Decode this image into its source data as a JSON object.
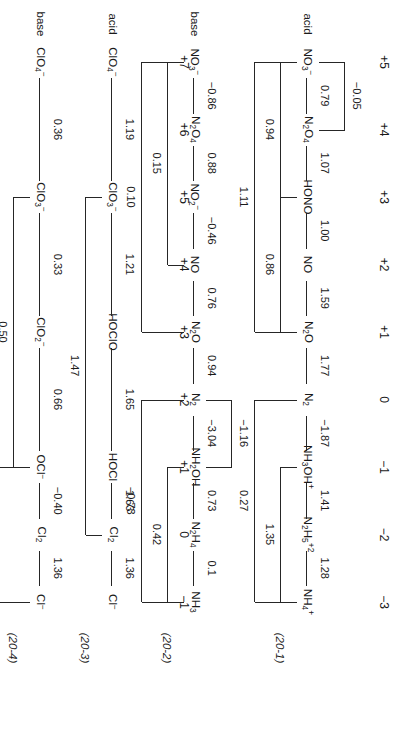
{
  "figure": {
    "kind": "latimer-diagrams",
    "labels": [
      "(20-1)",
      "(20-2)",
      "(20-3)",
      "(20-4)"
    ],
    "row_labels": {
      "acid": "acid",
      "base": "base"
    }
  },
  "chart_data": {
    "type": "diagram",
    "subtype": "latimer",
    "units": "V",
    "panels": [
      {
        "id": "20-1",
        "label": "(20-1)",
        "row_label": "acid",
        "element": "N",
        "oxidation_states": [
          "+5",
          "+4",
          "+3",
          "+2",
          "+1",
          "0",
          "-1",
          "-2",
          "-3"
        ],
        "species": [
          "NO3-",
          "N2O4",
          "HONO",
          "NO",
          "N2O",
          "N2",
          "NH3OH+",
          "N2H5+2",
          "NH4+"
        ],
        "species_display": [
          "NO₃⁻",
          "N₂O₄",
          "HONO",
          "NO",
          "N₂O",
          "N₂",
          "NH₃OH⁺",
          "N₂H₅⁺²",
          "NH₄⁺"
        ],
        "steps": [
          {
            "from": "NO3-",
            "to": "N2O4",
            "E": "0.79"
          },
          {
            "from": "N2O4",
            "to": "HONO",
            "E": "1.07"
          },
          {
            "from": "HONO",
            "to": "NO",
            "E": "1.00"
          },
          {
            "from": "NO",
            "to": "N2O",
            "E": "1.59"
          },
          {
            "from": "N2O",
            "to": "N2",
            "E": "1.77"
          },
          {
            "from": "N2",
            "to": "NH3OH+",
            "E": "-1.87"
          },
          {
            "from": "NH3OH+",
            "to": "N2H5+2",
            "E": "1.41"
          },
          {
            "from": "N2H5+2",
            "to": "NH4+",
            "E": "1.28"
          }
        ],
        "brackets": [
          {
            "from": "NO3-",
            "to": "N2O4",
            "E": "-0.05",
            "tier": 1,
            "side": "over"
          },
          {
            "from": "NO3-",
            "to": "HONO",
            "E": "0.94",
            "tier": 1,
            "side": "under"
          },
          {
            "from": "HONO",
            "to": "N2O",
            "E": "0.86",
            "tier": 1,
            "side": "under"
          },
          {
            "from": "NO3-",
            "to": "N2O",
            "E": "1.11",
            "tier": 2,
            "side": "under"
          },
          {
            "from": "NH3OH+",
            "to": "NH4+",
            "E": "1.35",
            "tier": 1,
            "side": "under"
          },
          {
            "from": "N2",
            "to": "NH4+",
            "E": "0.27",
            "tier": 2,
            "side": "under"
          }
        ]
      },
      {
        "id": "20-2",
        "label": "(20-2)",
        "row_label": "base",
        "element": "N",
        "oxidation_states": [
          "+5",
          "+4",
          "+3",
          "+2",
          "+1",
          "0",
          "-1",
          "-2",
          "-3"
        ],
        "species": [
          "NO3-",
          "N2O4",
          "NO2-",
          "NO",
          "N2O",
          "N2",
          "NH2OH",
          "N2H4",
          "NH3"
        ],
        "species_display": [
          "NO₃⁻",
          "N₂O₄",
          "NO₂⁻",
          "NO",
          "N₂O",
          "N₂",
          "NH₂OH",
          "N₂H₄",
          "NH₃"
        ],
        "steps": [
          {
            "from": "NO3-",
            "to": "N2O4",
            "E": "-0.86"
          },
          {
            "from": "N2O4",
            "to": "NO2-",
            "E": "0.88"
          },
          {
            "from": "NO2-",
            "to": "NO",
            "E": "-0.46"
          },
          {
            "from": "NO",
            "to": "N2O",
            "E": "0.76"
          },
          {
            "from": "N2O",
            "to": "N2",
            "E": "0.94"
          },
          {
            "from": "N2",
            "to": "NH2OH",
            "E": "-3.04"
          },
          {
            "from": "NH2OH",
            "to": "N2H4",
            "E": "0.73"
          },
          {
            "from": "N2H4",
            "to": "NH3",
            "E": "0.1"
          }
        ],
        "brackets": [
          {
            "from": "NO3-",
            "to": "NO",
            "E": "0.15",
            "tier": 1,
            "side": "under"
          },
          {
            "from": "NO3-",
            "to": "N2O",
            "E": "0.10",
            "tier": 2,
            "side": "under"
          },
          {
            "from": "N2",
            "to": "NH2OH",
            "E": "-1.16",
            "tier": 1,
            "side": "over"
          },
          {
            "from": "NH2OH",
            "to": "NH3",
            "E": "0.42",
            "tier": 1,
            "side": "under"
          },
          {
            "from": "N2",
            "to": "NH3",
            "E": "-0.73",
            "tier": 2,
            "side": "under"
          }
        ]
      },
      {
        "id": "20-3",
        "label": "(20-3)",
        "row_label": "acid",
        "element": "Cl",
        "oxidation_states": [
          "+7",
          "+6",
          "+5",
          "+4",
          "+3",
          "+2",
          "+1",
          "0",
          "-1"
        ],
        "species": [
          "ClO4-",
          "ClO3-",
          "HOClO",
          "HOCl",
          "Cl2",
          "Cl-"
        ],
        "species_display": [
          "ClO₄⁻",
          "ClO₃⁻",
          "HOClO",
          "HOCl",
          "Cl₂",
          "Cl⁻"
        ],
        "steps": [
          {
            "from": "ClO4-",
            "to": "ClO3-",
            "E": "1.19"
          },
          {
            "from": "ClO3-",
            "to": "HOClO",
            "E": "1.21"
          },
          {
            "from": "HOClO",
            "to": "HOCl",
            "E": "1.65"
          },
          {
            "from": "HOCl",
            "to": "Cl2",
            "E": "1.63"
          },
          {
            "from": "Cl2",
            "to": "Cl-",
            "E": "1.36"
          }
        ],
        "brackets": [
          {
            "from": "ClO3-",
            "to": "Cl2",
            "E": "1.47",
            "tier": 1,
            "side": "under"
          }
        ]
      },
      {
        "id": "20-4",
        "label": "(20-4)",
        "row_label": "base",
        "element": "Cl",
        "oxidation_states": [
          "+7",
          "+6",
          "+5",
          "+4",
          "+3",
          "+2",
          "+1",
          "0",
          "-1"
        ],
        "species": [
          "ClO4-",
          "ClO3-",
          "ClO2-",
          "OCl-",
          "Cl2",
          "Cl-"
        ],
        "species_display": [
          "ClO₄⁻",
          "ClO₃⁻",
          "ClO₂⁻",
          "OCl⁻",
          "Cl₂",
          "Cl⁻"
        ],
        "steps": [
          {
            "from": "ClO4-",
            "to": "ClO3-",
            "E": "0.36"
          },
          {
            "from": "ClO3-",
            "to": "ClO2-",
            "E": "0.33"
          },
          {
            "from": "ClO2-",
            "to": "OCl-",
            "E": "0.66"
          },
          {
            "from": "OCl-",
            "to": "Cl2",
            "E": "-0.40"
          },
          {
            "from": "Cl2",
            "to": "Cl-",
            "E": "1.36"
          }
        ],
        "brackets": [
          {
            "from": "ClO3-",
            "to": "OCl-",
            "E": "0.50",
            "tier": 1,
            "side": "under"
          },
          {
            "from": "OCl-",
            "to": "Cl-",
            "E": "0.88",
            "tier": 2,
            "side": "under"
          }
        ]
      }
    ]
  }
}
